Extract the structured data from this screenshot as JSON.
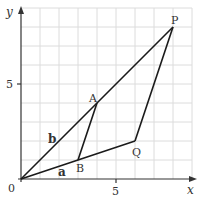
{
  "diagram": {
    "axes": {
      "x_label": "x",
      "y_label": "y",
      "origin_label": "0",
      "x_tick_label": "5",
      "y_tick_label": "5",
      "x_range": [
        0,
        9
      ],
      "y_range": [
        0,
        9
      ],
      "grid": true
    },
    "points": {
      "O": {
        "label": "O",
        "x": 0,
        "y": 0
      },
      "A": {
        "label": "A",
        "x": 4,
        "y": 4
      },
      "B": {
        "label": "B",
        "x": 3,
        "y": 1
      },
      "P": {
        "label": "P",
        "x": 8,
        "y": 8
      },
      "Q": {
        "label": "Q",
        "x": 6,
        "y": 2
      }
    },
    "segments": [
      [
        "O",
        "P"
      ],
      [
        "O",
        "Q"
      ],
      [
        "A",
        "B"
      ],
      [
        "P",
        "Q"
      ]
    ],
    "vector_labels": {
      "a": "a",
      "b": "b"
    },
    "colors": {
      "line": "#1a1a1a",
      "grid": "#dcdcdc",
      "text": "#333333"
    }
  }
}
